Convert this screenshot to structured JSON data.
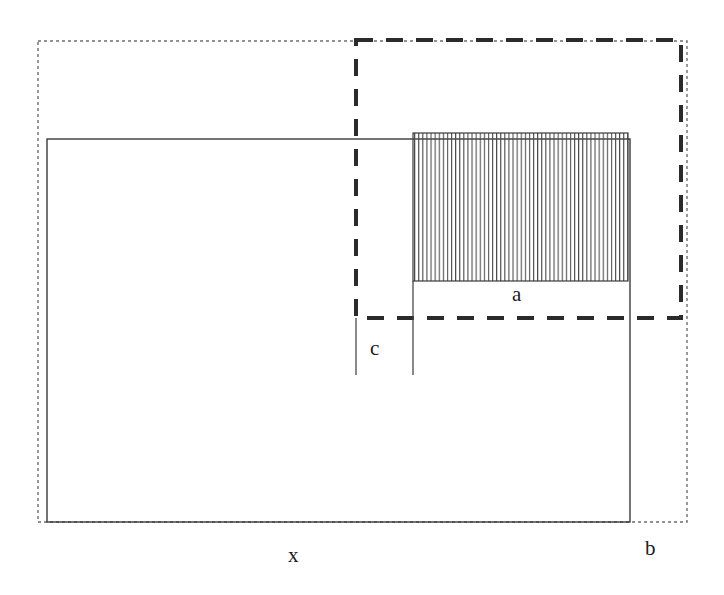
{
  "figure": {
    "background_color": "#ffffff",
    "width": 724,
    "height": 595,
    "labels": [
      {
        "id": "a",
        "text": "a",
        "x": 512,
        "y": 284
      },
      {
        "id": "c",
        "text": "c",
        "x": 370,
        "y": 338
      },
      {
        "id": "x",
        "text": "x",
        "x": 288,
        "y": 545
      },
      {
        "id": "b",
        "text": "b",
        "x": 645,
        "y": 538
      }
    ],
    "shapes": {
      "dotted_rect": {
        "name": "outer-dotted-rectangle",
        "x": 38,
        "y": 41,
        "width": 649,
        "height": 481,
        "stroke": "#6e6e6e",
        "stroke_width": 1.4,
        "dash": "3,3",
        "style": "dotted"
      },
      "solid_rect": {
        "name": "solid-rectangle-x",
        "x": 47,
        "y": 139,
        "width": 583,
        "height": 383,
        "stroke": "#3a3a3a",
        "stroke_width": 1.4,
        "style": "solid"
      },
      "dashed_rect": {
        "name": "thick-dashed-rectangle-b",
        "x": 356,
        "y": 40,
        "width": 325,
        "height": 278,
        "stroke": "#2b2b2b",
        "stroke_width": 4,
        "dash": "17,13",
        "style": "dashed"
      },
      "hatched_rect": {
        "name": "hatched-rectangle-a",
        "x": 413,
        "y": 133,
        "width": 215,
        "height": 148,
        "stroke": "#3a3a3a",
        "stroke_width": 1.2,
        "fill_pattern": "vertical-lines",
        "hatch_spacing": 4.1,
        "hatch_stroke": "#4a4a4a",
        "hatch_stroke_width": 1.1
      },
      "tick_lines": [
        {
          "name": "tick-line-left-c",
          "x1": 356,
          "y1": 318,
          "x2": 356,
          "y2": 375,
          "stroke": "#4a4a4a",
          "stroke_width": 1.3
        },
        {
          "name": "tick-line-right-c",
          "x1": 413,
          "y1": 281,
          "x2": 413,
          "y2": 375,
          "stroke": "#4a4a4a",
          "stroke_width": 1.3
        }
      ]
    }
  }
}
